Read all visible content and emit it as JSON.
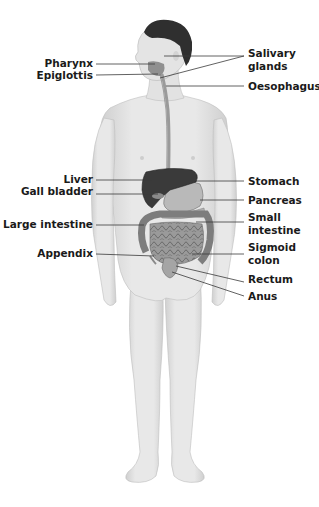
{
  "labels": {
    "pharynx": "Pharynx",
    "epiglottis": "Epiglottis",
    "salivary_glands_1": "Salivary",
    "salivary_glands_2": "glands",
    "oesophagus": "Oesophagus",
    "liver": "Liver",
    "gall_bladder": "Gall bladder",
    "large_intestine": "Large intestine",
    "appendix": "Appendix",
    "stomach": "Stomach",
    "pancreas": "Pancreas",
    "small_intestine_1": "Small",
    "small_intestine_2": "intestine",
    "sigmoid_colon_1": "Sigmoid",
    "sigmoid_colon_2": "colon",
    "rectum": "Rectum",
    "anus": "Anus"
  },
  "colors": {
    "skin": "#e6e6e6",
    "skin_shade": "#cfcfcf",
    "hair": "#2f2f2f",
    "liver": "#3a3a3a",
    "organ": "#a8a8a8",
    "intestine": "#8e8e8e",
    "text": "#1a1a1a"
  }
}
